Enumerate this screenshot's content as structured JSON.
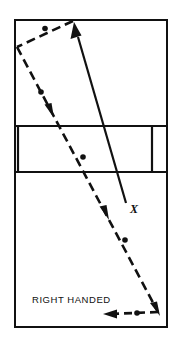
{
  "diagram": {
    "title_label": "RIGHT HANDED",
    "target_marker_label": "X",
    "colors": {
      "ink": "#111111",
      "background": "#ffffff"
    },
    "frame": {
      "name": "bowling-lane-outline",
      "x": 15,
      "y": 20,
      "width": 152,
      "height": 307
    },
    "arrow_band": {
      "name": "lane-arrow-band",
      "top_y": 126,
      "bottom_y": 172,
      "left_divider_x": 18,
      "right_divider_x": 152
    },
    "target_line": {
      "name": "target-line",
      "style": "solid",
      "start_x": 126,
      "start_y": 203,
      "end_x": 74,
      "end_y": 24,
      "arrow_at": "end",
      "direction": "up-left"
    },
    "ball_path": {
      "name": "ball-path-line",
      "style": "dash-dot",
      "points": [
        {
          "x": 73,
          "y": 21
        },
        {
          "x": 17,
          "y": 47
        },
        {
          "x": 158,
          "y": 312
        },
        {
          "x": 104,
          "y": 314
        }
      ],
      "dot_markers": [
        {
          "x": 45,
          "y": 28
        },
        {
          "x": 41,
          "y": 93
        },
        {
          "x": 83,
          "y": 157
        },
        {
          "x": 125,
          "y": 240
        },
        {
          "x": 137,
          "y": 313
        }
      ],
      "arrow_markers": [
        {
          "x": 51,
          "y": 112,
          "angle": 62
        },
        {
          "x": 106,
          "y": 214,
          "angle": 62
        },
        {
          "x": 158,
          "y": 312,
          "angle": 62
        },
        {
          "x": 106,
          "y": 314,
          "angle": 180
        }
      ]
    },
    "text_position": {
      "label_x": 32,
      "label_y": 303
    }
  }
}
